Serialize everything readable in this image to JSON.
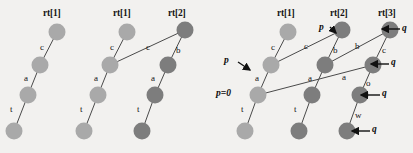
{
  "figure": {
    "background": "#f2f1ef",
    "node_light": "#a9a9a9",
    "node_dark": "#7d7d7d",
    "node_radius": 8.5,
    "edge_color": "#4a4a4a",
    "arrow_color": "#111111"
  },
  "panels": [
    {
      "id": "panel-1",
      "headers": [
        {
          "text": "rt[1]",
          "x": 43,
          "y": 8
        }
      ],
      "nodes": [
        {
          "id": "p1n1",
          "cx": 57,
          "cy": 32,
          "shade": "light"
        },
        {
          "id": "p1n2",
          "cx": 40,
          "cy": 65,
          "shade": "light"
        },
        {
          "id": "p1n3",
          "cx": 28,
          "cy": 95,
          "shade": "light"
        },
        {
          "id": "p1n4",
          "cx": 14,
          "cy": 131,
          "shade": "light"
        }
      ],
      "edges": [
        {
          "from": "p1n1",
          "to": "p1n2",
          "label": "c",
          "lx": 40,
          "ly": 42
        },
        {
          "from": "p1n2",
          "to": "p1n3",
          "label": "a",
          "lx": 24,
          "ly": 73
        },
        {
          "from": "p1n3",
          "to": "p1n4",
          "label": "t",
          "lx": 10,
          "ly": 104
        }
      ],
      "pointers": []
    },
    {
      "id": "panel-2",
      "headers": [
        {
          "text": "rt[1]",
          "x": 113,
          "y": 8
        },
        {
          "text": "rt[2]",
          "x": 168,
          "y": 8
        }
      ],
      "nodes": [
        {
          "id": "p2n1",
          "cx": 127,
          "cy": 32,
          "shade": "light"
        },
        {
          "id": "p2n2",
          "cx": 110,
          "cy": 65,
          "shade": "light"
        },
        {
          "id": "p2n3",
          "cx": 98,
          "cy": 95,
          "shade": "light"
        },
        {
          "id": "p2n4",
          "cx": 84,
          "cy": 131,
          "shade": "light"
        },
        {
          "id": "p2m1",
          "cx": 185,
          "cy": 30,
          "shade": "dark"
        },
        {
          "id": "p2m2",
          "cx": 168,
          "cy": 65,
          "shade": "dark"
        },
        {
          "id": "p2m3",
          "cx": 155,
          "cy": 95,
          "shade": "dark"
        },
        {
          "id": "p2m4",
          "cx": 142,
          "cy": 131,
          "shade": "dark"
        }
      ],
      "edges": [
        {
          "from": "p2n1",
          "to": "p2n2",
          "label": "c",
          "lx": 110,
          "ly": 42
        },
        {
          "from": "p2n2",
          "to": "p2n3",
          "label": "a",
          "lx": 94,
          "ly": 73
        },
        {
          "from": "p2n3",
          "to": "p2n4",
          "label": "t",
          "lx": 80,
          "ly": 104
        },
        {
          "from": "p2m1",
          "to": "p2n2",
          "label": "c",
          "lx": 146,
          "ly": 42
        },
        {
          "from": "p2m1",
          "to": "p2m2",
          "label": "b",
          "lx": 176,
          "ly": 45
        },
        {
          "from": "p2m2",
          "to": "p2m3",
          "label": "a",
          "lx": 151,
          "ly": 73
        },
        {
          "from": "p2m3",
          "to": "p2m4",
          "label": "t",
          "lx": 137,
          "ly": 104
        }
      ],
      "pointers": []
    },
    {
      "id": "panel-3",
      "headers": [
        {
          "text": "rt[1]",
          "x": 277,
          "y": 8
        },
        {
          "text": "rt[2]",
          "x": 330,
          "y": 8
        },
        {
          "text": "rt[3]",
          "x": 378,
          "y": 8
        }
      ],
      "nodes": [
        {
          "id": "p3a1",
          "cx": 288,
          "cy": 32,
          "shade": "light"
        },
        {
          "id": "p3a2",
          "cx": 271,
          "cy": 65,
          "shade": "light"
        },
        {
          "id": "p3a3",
          "cx": 258,
          "cy": 95,
          "shade": "light"
        },
        {
          "id": "p3a4",
          "cx": 245,
          "cy": 131,
          "shade": "light"
        },
        {
          "id": "p3b1",
          "cx": 342,
          "cy": 30,
          "shade": "dark"
        },
        {
          "id": "p3b2",
          "cx": 325,
          "cy": 65,
          "shade": "dark"
        },
        {
          "id": "p3b3",
          "cx": 312,
          "cy": 95,
          "shade": "dark"
        },
        {
          "id": "p3b4",
          "cx": 299,
          "cy": 131,
          "shade": "dark"
        },
        {
          "id": "p3c1",
          "cx": 390,
          "cy": 30,
          "shade": "dark"
        },
        {
          "id": "p3c2",
          "cx": 373,
          "cy": 65,
          "shade": "dark"
        },
        {
          "id": "p3c3",
          "cx": 360,
          "cy": 95,
          "shade": "dark"
        },
        {
          "id": "p3c4",
          "cx": 347,
          "cy": 131,
          "shade": "dark"
        }
      ],
      "edges": [
        {
          "from": "p3a1",
          "to": "p3a2",
          "label": "c",
          "lx": 271,
          "ly": 42
        },
        {
          "from": "p3a2",
          "to": "p3a3",
          "label": "a",
          "lx": 255,
          "ly": 73
        },
        {
          "from": "p3a3",
          "to": "p3a4",
          "label": "t",
          "lx": 241,
          "ly": 104
        },
        {
          "from": "p3b1",
          "to": "p3a2",
          "label": "c",
          "lx": 304,
          "ly": 41
        },
        {
          "from": "p3b1",
          "to": "p3b2",
          "label": "b",
          "lx": 333,
          "ly": 45
        },
        {
          "from": "p3b2",
          "to": "p3b3",
          "label": "a",
          "lx": 308,
          "ly": 73
        },
        {
          "from": "p3b3",
          "to": "p3b4",
          "label": "t",
          "lx": 294,
          "ly": 104
        },
        {
          "from": "p3c1",
          "to": "p3b2",
          "label": "b",
          "lx": 355,
          "ly": 41
        },
        {
          "from": "p3c1",
          "to": "p3c2",
          "label": "c",
          "lx": 382,
          "ly": 45
        },
        {
          "from": "p3c2",
          "to": "p3a3",
          "label": "a",
          "lx": 342,
          "ly": 72
        },
        {
          "from": "p3c2",
          "to": "p3c3",
          "label": "o",
          "lx": 366,
          "ly": 78
        },
        {
          "from": "p3c3",
          "to": "p3c4",
          "label": "w",
          "lx": 355,
          "ly": 110
        }
      ],
      "pointers": [
        {
          "label": "p",
          "lx": 224,
          "ly": 55,
          "ax1": 238,
          "ay1": 62,
          "ax2": 250,
          "ay2": 70,
          "arrow": true
        },
        {
          "label": "p",
          "lx": 319,
          "ly": 22,
          "ax1": 330,
          "ay1": 27,
          "ax2": 336,
          "ay2": 33,
          "arrow": true
        },
        {
          "label": "p=0",
          "lx": 216,
          "ly": 88,
          "arrow": false
        },
        {
          "label": "q",
          "lx": 402,
          "ly": 23,
          "ax1": 400,
          "ay1": 29,
          "ax2": 382,
          "ay2": 29,
          "arrow": true
        },
        {
          "label": "q",
          "lx": 391,
          "ly": 57,
          "ax1": 389,
          "ay1": 64,
          "ax2": 371,
          "ay2": 64,
          "arrow": true
        },
        {
          "label": "q",
          "lx": 382,
          "ly": 88,
          "ax1": 380,
          "ay1": 95,
          "ax2": 361,
          "ay2": 95,
          "arrow": true
        },
        {
          "label": "q",
          "lx": 372,
          "ly": 124,
          "ax1": 370,
          "ay1": 131,
          "ax2": 352,
          "ay2": 131,
          "arrow": true
        }
      ]
    }
  ]
}
